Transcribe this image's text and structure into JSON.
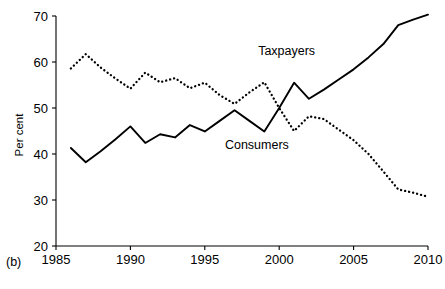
{
  "chart_data": {
    "type": "line",
    "title": "",
    "subtitle": "",
    "panel_label": "(b)",
    "xlabel": "",
    "ylabel": "Per cent",
    "xlim": [
      1985,
      2010
    ],
    "ylim": [
      20,
      70
    ],
    "xticks": [
      1985,
      1990,
      1995,
      2000,
      2005,
      2010
    ],
    "xtick_labels": [
      "1985",
      "1990",
      "1995",
      "2000",
      "2005",
      "2010"
    ],
    "yticks": [
      20,
      30,
      40,
      50,
      60,
      70
    ],
    "ytick_labels": [
      "20",
      "30",
      "40",
      "50",
      "60",
      "70"
    ],
    "grid": false,
    "legend_position": "inline-annotations",
    "annotations": [
      {
        "text": "Taxpayers",
        "x": 2000.5,
        "y": 61.5
      },
      {
        "text": "Consumers",
        "x": 1998.5,
        "y": 41.0
      }
    ],
    "series": [
      {
        "name": "Taxpayers",
        "style": "solid",
        "color": "#000000",
        "x": [
          1986,
          1987,
          1988,
          1989,
          1990,
          1991,
          1992,
          1993,
          1994,
          1995,
          1996,
          1997,
          1998,
          1999,
          2000,
          2001,
          2002,
          2003,
          2004,
          2005,
          2006,
          2007,
          2008,
          2009,
          2010
        ],
        "values": [
          41.3,
          38.2,
          40.6,
          43.2,
          46.0,
          42.4,
          44.3,
          43.6,
          46.3,
          44.9,
          47.2,
          49.5,
          47.2,
          44.9,
          50.0,
          55.5,
          52.0,
          54.0,
          56.2,
          58.4,
          61.0,
          63.9,
          68.0,
          69.2,
          70.3
        ]
      },
      {
        "name": "Consumers",
        "style": "dotted",
        "color": "#000000",
        "x": [
          1986,
          1987,
          1988,
          1989,
          1990,
          1991,
          1992,
          1993,
          1994,
          1995,
          1996,
          1997,
          1998,
          1999,
          2000,
          2001,
          2002,
          2003,
          2004,
          2005,
          2006,
          2007,
          2008,
          2009,
          2010
        ],
        "values": [
          58.6,
          61.7,
          58.8,
          56.4,
          54.2,
          57.7,
          55.6,
          56.5,
          54.3,
          55.5,
          52.8,
          50.9,
          53.4,
          55.6,
          50.0,
          45.0,
          48.2,
          47.6,
          45.3,
          43.0,
          40.0,
          36.2,
          32.3,
          31.6,
          30.7
        ]
      }
    ]
  },
  "axis": {
    "y_title": "Per cent",
    "panel_tag": "(b)"
  }
}
